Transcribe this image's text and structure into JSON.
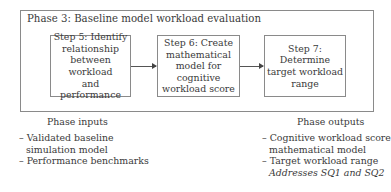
{
  "phase": {
    "title": "Phase 3: Baseline model workload evaluation"
  },
  "steps": [
    {
      "lines": [
        "Step 5: Identify",
        "relationship",
        "between workload",
        "and performance"
      ]
    },
    {
      "lines": [
        "Step 6: Create",
        "mathematical",
        "model for cognitive",
        "workload score"
      ]
    },
    {
      "lines": [
        "Step 7: Determine",
        "target workload",
        "range"
      ]
    }
  ],
  "inputs": {
    "heading": "Phase inputs",
    "items": [
      {
        "lines": [
          "– Validated baseline",
          "simulation model"
        ]
      },
      {
        "lines": [
          "– Performance benchmarks"
        ]
      }
    ]
  },
  "outputs": {
    "heading": "Phase outputs",
    "items": [
      {
        "lines": [
          "– Cognitive workload score",
          "mathematical model"
        ]
      },
      {
        "lines": [
          "– Target workload range"
        ]
      }
    ],
    "note": "Addresses SQ1 and SQ2"
  },
  "colors": {
    "border": "#8a8a8a",
    "text": "#3a3a3a",
    "arrow": "#555555"
  }
}
